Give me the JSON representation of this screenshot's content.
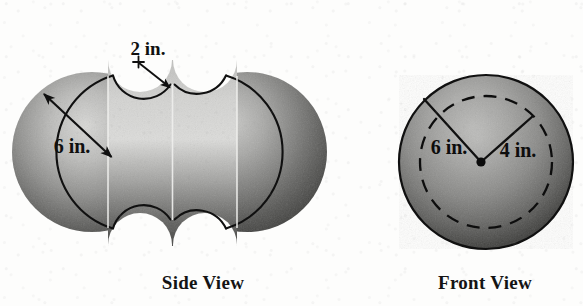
{
  "figure": {
    "background_color": "#fdfdfc",
    "ink_color": "#101010",
    "views": [
      {
        "name": "side-view",
        "caption": "Side View",
        "shape": "two joined spheres with four circular grooves cut at top and bottom",
        "annotations": [
          {
            "id": "groove-depth",
            "label": "2 in.",
            "label_x": 148,
            "label_y": 48,
            "leader_from": [
              139,
              62
            ],
            "leader_to": [
              171,
              88
            ],
            "arrow": "single",
            "tick_mark": "cross"
          },
          {
            "id": "sphere-radius",
            "label": "6 in.",
            "label_x": 72,
            "label_y": 146,
            "leader_from": [
              44,
              94
            ],
            "leader_to": [
              111,
              157
            ],
            "arrow": "double",
            "tick_mark": "none"
          }
        ]
      },
      {
        "name": "front-view",
        "caption": "Front View",
        "shape": "sphere with inner dashed groove circle",
        "annotations": [
          {
            "id": "outer-radius",
            "label": "6 in.",
            "label_x": 449,
            "label_y": 147,
            "leader_from": [
              481,
              162
            ],
            "leader_to": [
              424,
              99
            ],
            "arrow": "none",
            "tick_mark": "none"
          },
          {
            "id": "groove-radius",
            "label": "4 in.",
            "label_x": 517,
            "label_y": 150,
            "leader_from": [
              481,
              162
            ],
            "leader_to": [
              533,
              116
            ],
            "arrow": "none",
            "tick_mark": "none"
          }
        ]
      }
    ]
  }
}
